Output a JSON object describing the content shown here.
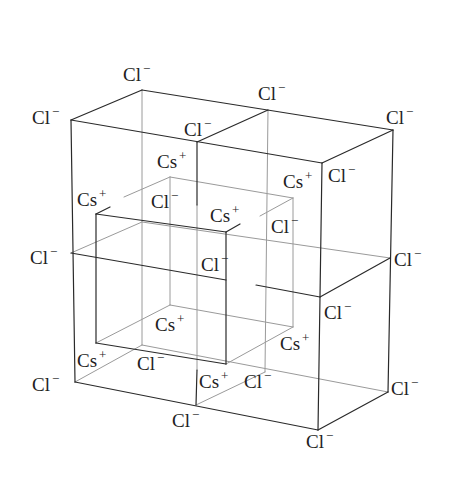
{
  "figure": {
    "background": "#ffffff",
    "colors": {
      "solid_line": "#2a2a2a",
      "light_line": "#9a9a9a",
      "text": "#1e1e1e"
    },
    "solid_edges": [
      [
        142,
        90,
        393,
        130
      ],
      [
        71,
        120,
        322,
        163
      ],
      [
        71,
        120,
        142,
        90
      ],
      [
        322,
        163,
        393,
        130
      ],
      [
        197,
        142,
        268,
        110
      ],
      [
        71,
        120,
        75,
        382
      ],
      [
        322,
        163,
        318,
        430
      ],
      [
        393,
        130,
        388,
        392
      ],
      [
        197,
        142,
        197,
        205
      ],
      [
        75,
        382,
        318,
        430
      ],
      [
        318,
        430,
        388,
        392
      ],
      [
        71,
        253,
        226,
        280
      ],
      [
        256,
        285,
        320,
        297
      ],
      [
        320,
        297,
        390,
        258
      ],
      [
        197,
        370,
        196,
        405
      ],
      [
        96,
        214,
        226,
        232
      ],
      [
        96,
        214,
        96,
        343
      ],
      [
        226,
        232,
        226,
        364
      ],
      [
        96,
        343,
        226,
        364
      ],
      [
        226,
        232,
        240,
        224
      ],
      [
        96,
        214,
        110,
        207
      ]
    ],
    "light_edges": [
      [
        142,
        90,
        142,
        345
      ],
      [
        268,
        110,
        265,
        372
      ],
      [
        142,
        222,
        390,
        258
      ],
      [
        71,
        253,
        142,
        222
      ],
      [
        75,
        382,
        142,
        345
      ],
      [
        142,
        345,
        388,
        392
      ],
      [
        196,
        405,
        265,
        372
      ],
      [
        197,
        205,
        197,
        370
      ],
      [
        170,
        177,
        293,
        198
      ],
      [
        170,
        177,
        124,
        197
      ],
      [
        293,
        198,
        260,
        216
      ],
      [
        170,
        177,
        170,
        305
      ],
      [
        293,
        198,
        293,
        327
      ],
      [
        96,
        343,
        170,
        305
      ],
      [
        170,
        305,
        293,
        327
      ],
      [
        226,
        364,
        293,
        327
      ]
    ],
    "labels": [
      {
        "ion": "Cl",
        "charge": "−",
        "x": 123,
        "y": 81
      },
      {
        "ion": "Cl",
        "charge": "−",
        "x": 258,
        "y": 100
      },
      {
        "ion": "Cl",
        "charge": "−",
        "x": 386,
        "y": 124
      },
      {
        "ion": "Cl",
        "charge": "−",
        "x": 32,
        "y": 124
      },
      {
        "ion": "Cl",
        "charge": "−",
        "x": 184,
        "y": 136
      },
      {
        "ion": "Cs",
        "charge": "+",
        "x": 157,
        "y": 168
      },
      {
        "ion": "Cs",
        "charge": "+",
        "x": 283,
        "y": 188
      },
      {
        "ion": "Cl",
        "charge": "−",
        "x": 328,
        "y": 182
      },
      {
        "ion": "Cs",
        "charge": "+",
        "x": 77,
        "y": 206
      },
      {
        "ion": "Cl",
        "charge": "−",
        "x": 151,
        "y": 208
      },
      {
        "ion": "Cs",
        "charge": "+",
        "x": 210,
        "y": 222
      },
      {
        "ion": "Cl",
        "charge": "−",
        "x": 271,
        "y": 233
      },
      {
        "ion": "Cl",
        "charge": "−",
        "x": 30,
        "y": 264
      },
      {
        "ion": "Cl",
        "charge": "−",
        "x": 394,
        "y": 266
      },
      {
        "ion": "Cl",
        "charge": "−",
        "x": 201,
        "y": 271
      },
      {
        "ion": "Cl",
        "charge": "−",
        "x": 324,
        "y": 319
      },
      {
        "ion": "Cs",
        "charge": "+",
        "x": 155,
        "y": 331
      },
      {
        "ion": "Cs",
        "charge": "+",
        "x": 280,
        "y": 350
      },
      {
        "ion": "Cs",
        "charge": "+",
        "x": 77,
        "y": 367
      },
      {
        "ion": "Cl",
        "charge": "−",
        "x": 137,
        "y": 370
      },
      {
        "ion": "Cs",
        "charge": "+",
        "x": 199,
        "y": 388
      },
      {
        "ion": "Cl",
        "charge": "−",
        "x": 244,
        "y": 388
      },
      {
        "ion": "Cl",
        "charge": "−",
        "x": 32,
        "y": 391
      },
      {
        "ion": "Cl",
        "charge": "−",
        "x": 391,
        "y": 395
      },
      {
        "ion": "Cl",
        "charge": "−",
        "x": 172,
        "y": 427
      },
      {
        "ion": "Cl",
        "charge": "−",
        "x": 306,
        "y": 448
      }
    ]
  }
}
